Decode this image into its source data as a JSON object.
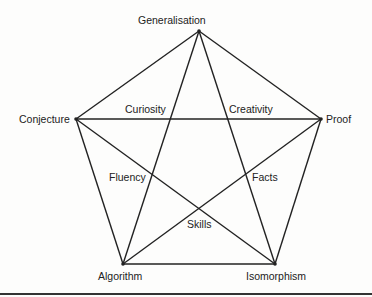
{
  "diagram": {
    "type": "pentagram-in-pentagon",
    "vertices": [
      {
        "id": "generalisation",
        "label": "Generalisation",
        "x": 199,
        "y": 31,
        "lx": 138,
        "ly": 14
      },
      {
        "id": "conjecture",
        "label": "Conjecture",
        "x": 76,
        "y": 119,
        "lx": 19,
        "ly": 113
      },
      {
        "id": "proof",
        "label": "Proof",
        "x": 321,
        "y": 119,
        "lx": 326,
        "ly": 113
      },
      {
        "id": "algorithm",
        "label": "Algorithm",
        "x": 123,
        "y": 264,
        "lx": 98,
        "ly": 270
      },
      {
        "id": "isomorphism",
        "label": "Isomorphism",
        "x": 275,
        "y": 264,
        "lx": 246,
        "ly": 270
      }
    ],
    "inner_labels": [
      {
        "id": "curiosity",
        "label": "Curiosity",
        "lx": 125,
        "ly": 103
      },
      {
        "id": "creativity",
        "label": "Creativity",
        "lx": 229,
        "ly": 103
      },
      {
        "id": "fluency",
        "label": "Fluency",
        "lx": 109,
        "ly": 171
      },
      {
        "id": "facts",
        "label": "Facts",
        "lx": 252,
        "ly": 171
      },
      {
        "id": "skills",
        "label": "Skills",
        "lx": 187,
        "ly": 218
      }
    ],
    "edges": [
      [
        "generalisation",
        "conjecture"
      ],
      [
        "generalisation",
        "proof"
      ],
      [
        "conjecture",
        "algorithm"
      ],
      [
        "proof",
        "isomorphism"
      ],
      [
        "algorithm",
        "isomorphism"
      ],
      [
        "generalisation",
        "algorithm"
      ],
      [
        "generalisation",
        "isomorphism"
      ],
      [
        "conjecture",
        "proof"
      ],
      [
        "conjecture",
        "isomorphism"
      ],
      [
        "proof",
        "algorithm"
      ]
    ],
    "line_color": "#222222"
  }
}
